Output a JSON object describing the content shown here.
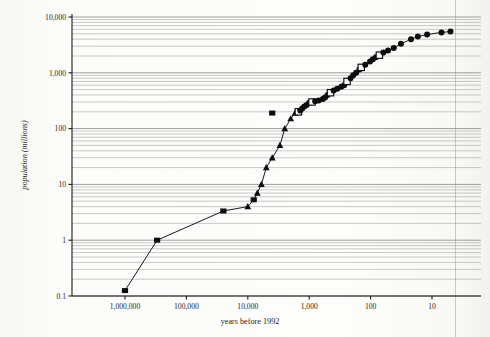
{
  "figure": {
    "background_color": "#fbfbf9",
    "grid_color": "#8d8d8d",
    "axis_color": "#1c1c1c",
    "marker_color": "#0d0d0d",
    "gutter_color": "#c9c9c4"
  },
  "axis_titles": {
    "y": "population (millions)",
    "x": "years before 1992"
  },
  "y_ticks": [
    {
      "value": 10000,
      "label": "10,000"
    },
    {
      "value": 1000,
      "label": "1,000"
    },
    {
      "value": 100,
      "label": "100"
    },
    {
      "value": 10,
      "label": "10"
    },
    {
      "value": 1,
      "label": "1"
    },
    {
      "value": 0.1,
      "label": "0.1"
    }
  ],
  "x_ticks": [
    {
      "value": 1000000,
      "label": "1,000,000"
    },
    {
      "value": 100000,
      "label": "100,000"
    },
    {
      "value": 10000,
      "label": "10,000"
    },
    {
      "value": 1000,
      "label": "1,000"
    },
    {
      "value": 100,
      "label": "100"
    },
    {
      "value": 10,
      "label": "10"
    }
  ],
  "chart_data": {
    "type": "line",
    "title": "",
    "xlabel": "years before 1992",
    "ylabel": "population (millions)",
    "xscale": "log",
    "yscale": "log",
    "x_reversed": true,
    "xlim": [
      3000000,
      5
    ],
    "ylim": [
      0.1,
      13000
    ],
    "grid": "horizontal-log-minor",
    "legend": "none",
    "series": [
      {
        "name": "world population",
        "marker": "mixed (filled square, filled triangle, filled/open circle)",
        "points": [
          {
            "x": 1000000,
            "y": 0.125,
            "marker": "square"
          },
          {
            "x": 300000,
            "y": 1.0,
            "marker": "square"
          },
          {
            "x": 25000,
            "y": 3.34,
            "marker": "square"
          },
          {
            "x": 10000,
            "y": 4.0,
            "marker": "triangle"
          },
          {
            "x": 8000,
            "y": 5.3,
            "marker": "square"
          },
          {
            "x": 7000,
            "y": 7.0,
            "marker": "triangle"
          },
          {
            "x": 6000,
            "y": 10.0,
            "marker": "triangle"
          },
          {
            "x": 5000,
            "y": 20.0,
            "marker": "triangle"
          },
          {
            "x": 4000,
            "y": 30.0,
            "marker": "triangle"
          },
          {
            "x": 3000,
            "y": 50.0,
            "marker": "triangle"
          },
          {
            "x": 4000,
            "y": 190.0,
            "marker": "square"
          },
          {
            "x": 2500,
            "y": 100.0,
            "marker": "triangle"
          },
          {
            "x": 2000,
            "y": 150.0,
            "marker": "triangle"
          },
          {
            "x": 1700,
            "y": 190.0,
            "marker": "triangle"
          },
          {
            "x": 1500,
            "y": 200.0,
            "marker": "square-open"
          },
          {
            "x": 1400,
            "y": 210.0,
            "marker": "circle"
          },
          {
            "x": 1300,
            "y": 230.0,
            "marker": "circle"
          },
          {
            "x": 1200,
            "y": 250.0,
            "marker": "circle"
          },
          {
            "x": 1100,
            "y": 265.0,
            "marker": "circle"
          },
          {
            "x": 1000,
            "y": 290.0,
            "marker": "circle"
          },
          {
            "x": 900,
            "y": 300.0,
            "marker": "square-open"
          },
          {
            "x": 800,
            "y": 310.0,
            "marker": "circle"
          },
          {
            "x": 700,
            "y": 320.0,
            "marker": "circle"
          },
          {
            "x": 600,
            "y": 340.0,
            "marker": "circle"
          },
          {
            "x": 550,
            "y": 360.0,
            "marker": "circle"
          },
          {
            "x": 500,
            "y": 400.0,
            "marker": "circle"
          },
          {
            "x": 450,
            "y": 440.0,
            "marker": "square-open"
          },
          {
            "x": 400,
            "y": 480.0,
            "marker": "circle"
          },
          {
            "x": 350,
            "y": 520.0,
            "marker": "circle"
          },
          {
            "x": 300,
            "y": 560.0,
            "marker": "circle"
          },
          {
            "x": 270,
            "y": 600.0,
            "marker": "circle"
          },
          {
            "x": 242,
            "y": 700.0,
            "marker": "square-open"
          },
          {
            "x": 212,
            "y": 800.0,
            "marker": "circle"
          },
          {
            "x": 192,
            "y": 900.0,
            "marker": "circle"
          },
          {
            "x": 172,
            "y": 1000.0,
            "marker": "circle"
          },
          {
            "x": 152,
            "y": 1150.0,
            "marker": "circle"
          },
          {
            "x": 142,
            "y": 1250.0,
            "marker": "square-open"
          },
          {
            "x": 122,
            "y": 1400.0,
            "marker": "circle"
          },
          {
            "x": 102,
            "y": 1600.0,
            "marker": "circle"
          },
          {
            "x": 92,
            "y": 1750.0,
            "marker": "circle"
          },
          {
            "x": 82,
            "y": 1900.0,
            "marker": "circle"
          },
          {
            "x": 72,
            "y": 2070.0,
            "marker": "square-open"
          },
          {
            "x": 62,
            "y": 2300.0,
            "marker": "circle"
          },
          {
            "x": 52,
            "y": 2500.0,
            "marker": "circle"
          },
          {
            "x": 42,
            "y": 2780.0,
            "marker": "circle"
          },
          {
            "x": 32,
            "y": 3300.0,
            "marker": "circle"
          },
          {
            "x": 22,
            "y": 4000.0,
            "marker": "circle"
          },
          {
            "x": 17,
            "y": 4450.0,
            "marker": "circle"
          },
          {
            "x": 12,
            "y": 4850.0,
            "marker": "circle"
          },
          {
            "x": 7,
            "y": 5300.0,
            "marker": "circle"
          },
          {
            "x": 5,
            "y": 5480.0,
            "marker": "circle"
          }
        ]
      }
    ]
  }
}
